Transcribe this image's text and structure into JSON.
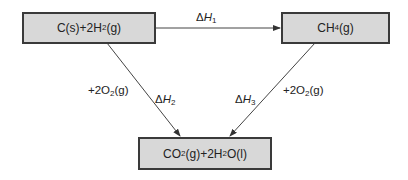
{
  "diagram": {
    "nodes": {
      "reactants": {
        "parts": [
          "C(s)+2H",
          "2",
          "(g)"
        ],
        "text": "C(s)+2H2(g)"
      },
      "methane": {
        "parts": [
          "CH",
          "4",
          "(g)"
        ],
        "text": "CH4(g)"
      },
      "products": {
        "parts": [
          "CO",
          "2",
          "(g)+2H",
          "2",
          "O(l)"
        ],
        "text": "CO2(g)+2H2O(l)"
      }
    },
    "edges": [
      {
        "from": "reactants",
        "to": "methane",
        "delta": {
          "sym": "Δ",
          "var": "H",
          "sub": "1"
        }
      },
      {
        "from": "reactants",
        "to": "products",
        "delta": {
          "sym": "Δ",
          "var": "H",
          "sub": "2"
        },
        "reagent": {
          "pre": "+2O",
          "sub": "2",
          "post": "(g)"
        }
      },
      {
        "from": "methane",
        "to": "products",
        "delta": {
          "sym": "Δ",
          "var": "H",
          "sub": "3"
        },
        "reagent": {
          "pre": "+2O",
          "sub": "2",
          "post": "(g)"
        }
      }
    ],
    "colors": {
      "box_fill": "#d8d8d8",
      "box_border": "#3a3a3a",
      "line": "#444444"
    }
  }
}
